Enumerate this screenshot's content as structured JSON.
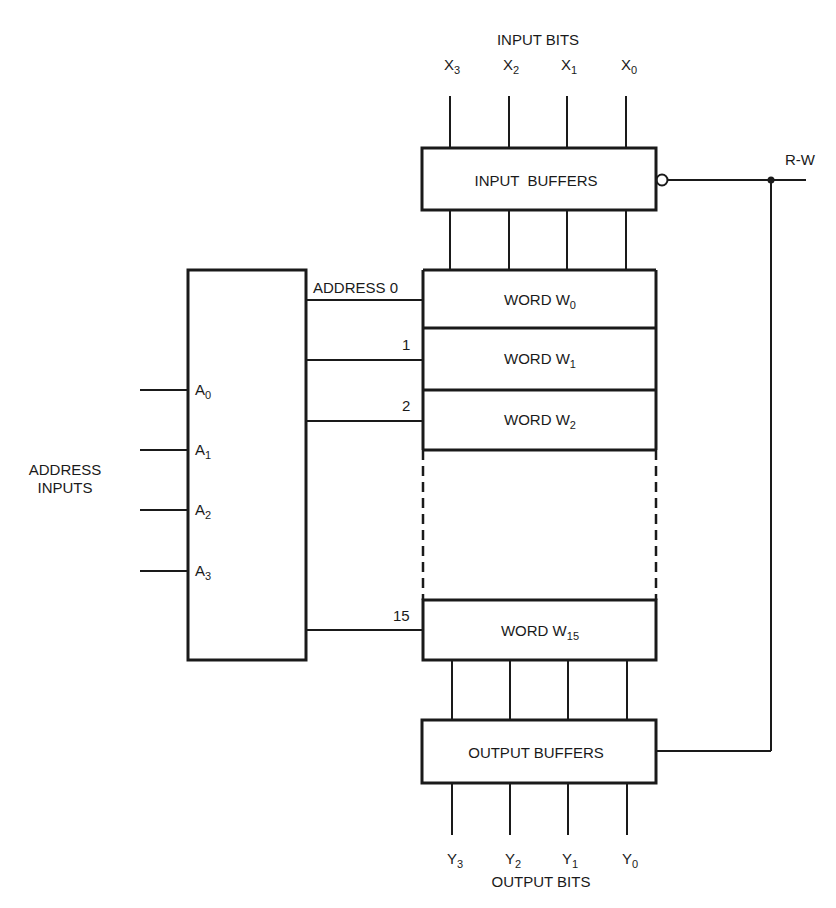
{
  "diagram": {
    "input_bits": {
      "title": "INPUT BITS",
      "bits": [
        {
          "base": "X",
          "sub": "3"
        },
        {
          "base": "X",
          "sub": "2"
        },
        {
          "base": "X",
          "sub": "1"
        },
        {
          "base": "X",
          "sub": "0"
        }
      ]
    },
    "input_buffers": {
      "label": "INPUT  BUFFERS"
    },
    "rw": {
      "label": "R-W"
    },
    "address_inputs": {
      "title_line1": "ADDRESS",
      "title_line2": "INPUTS",
      "pins": [
        {
          "base": "A",
          "sub": "0"
        },
        {
          "base": "A",
          "sub": "1"
        },
        {
          "base": "A",
          "sub": "2"
        },
        {
          "base": "A",
          "sub": "3"
        }
      ]
    },
    "address_lines": {
      "first": "ADDRESS 0",
      "second": "1",
      "third": "2",
      "last": "15"
    },
    "words": [
      {
        "prefix": "WORD W",
        "sub": "0"
      },
      {
        "prefix": "WORD W",
        "sub": "1"
      },
      {
        "prefix": "WORD W",
        "sub": "2"
      },
      {
        "prefix": "WORD W",
        "sub": "15"
      }
    ],
    "output_buffers": {
      "label": "OUTPUT BUFFERS"
    },
    "output_bits": {
      "title": "OUTPUT BITS",
      "bits": [
        {
          "base": "Y",
          "sub": "3"
        },
        {
          "base": "Y",
          "sub": "2"
        },
        {
          "base": "Y",
          "sub": "1"
        },
        {
          "base": "Y",
          "sub": "0"
        }
      ]
    },
    "colors": {
      "ink": "#1a1a1a",
      "background": "#ffffff"
    }
  }
}
